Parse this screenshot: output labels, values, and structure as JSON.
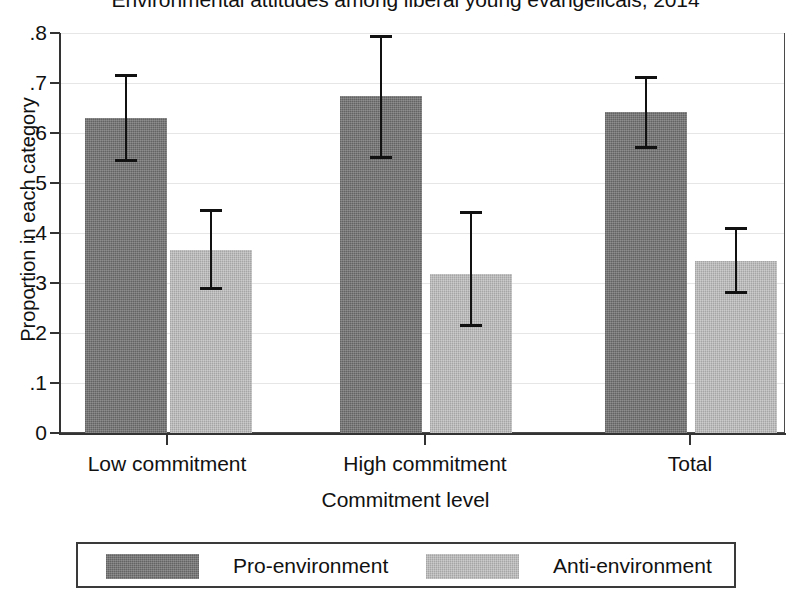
{
  "chart_data": {
    "type": "bar",
    "title": "Environmental attitudes among liberal young evangelicals, 2014",
    "xlabel": "Commitment level",
    "ylabel": "Proportion in each category",
    "categories": [
      "Low commitment",
      "High commitment",
      "Total"
    ],
    "ylim": [
      0,
      0.8
    ],
    "yticks": [
      0,
      0.1,
      0.2,
      0.3,
      0.4,
      0.5,
      0.6,
      0.7,
      0.8
    ],
    "ytick_labels": [
      "0",
      ".1",
      ".2",
      ".3",
      ".4",
      ".5",
      ".6",
      ".7",
      ".8"
    ],
    "grid": true,
    "legend_position": "bottom",
    "error_bars": "95% confidence interval",
    "series": [
      {
        "name": "Pro-environment",
        "color": "#6e6e6e",
        "values": [
          0.63,
          0.675,
          0.643
        ],
        "err_low": [
          0.546,
          0.551,
          0.572
        ],
        "err_high": [
          0.716,
          0.793,
          0.712
        ]
      },
      {
        "name": "Anti-environment",
        "color": "#b5b5b5",
        "values": [
          0.367,
          0.318,
          0.345
        ],
        "err_low": [
          0.289,
          0.215,
          0.281
        ],
        "err_high": [
          0.445,
          0.441,
          0.41
        ]
      }
    ]
  },
  "legend": {
    "items": [
      {
        "label": "Pro-environment",
        "color": "#6e6e6e"
      },
      {
        "label": "Anti-environment",
        "color": "#b5b5b5"
      }
    ]
  }
}
